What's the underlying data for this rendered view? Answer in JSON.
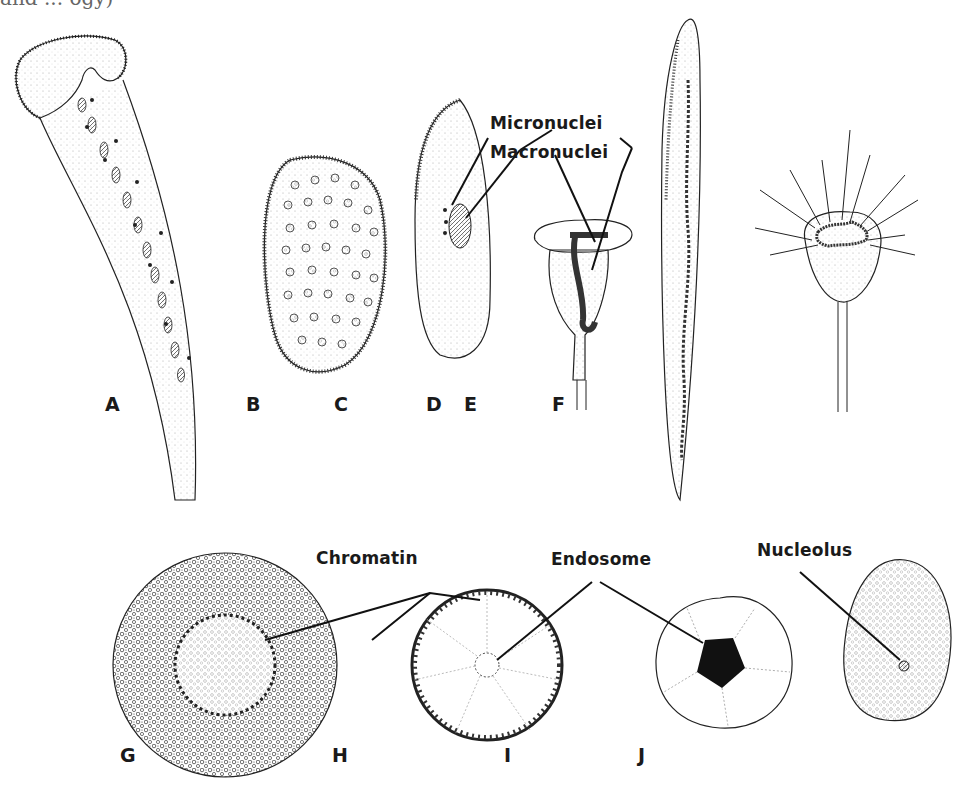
{
  "figure": {
    "caption_fragment": "and ... ogy)",
    "panels": [
      {
        "id": "A",
        "label": "A"
      },
      {
        "id": "B",
        "label": "B"
      },
      {
        "id": "C",
        "label": "C"
      },
      {
        "id": "D",
        "label": "D"
      },
      {
        "id": "E",
        "label": "E"
      },
      {
        "id": "F",
        "label": "F"
      },
      {
        "id": "G",
        "label": "G"
      },
      {
        "id": "H",
        "label": "H"
      },
      {
        "id": "I",
        "label": "I"
      },
      {
        "id": "J",
        "label": "J"
      }
    ],
    "callouts": {
      "micronuclei": "Micronuclei",
      "macronuclei": "Macronuclei",
      "chromatin": "Chromatin",
      "endosome": "Endosome",
      "nucleolus": "Nucleolus"
    },
    "colors": {
      "ink": "#1a1a1a",
      "stipple": "#555555",
      "background": "#ffffff"
    }
  }
}
